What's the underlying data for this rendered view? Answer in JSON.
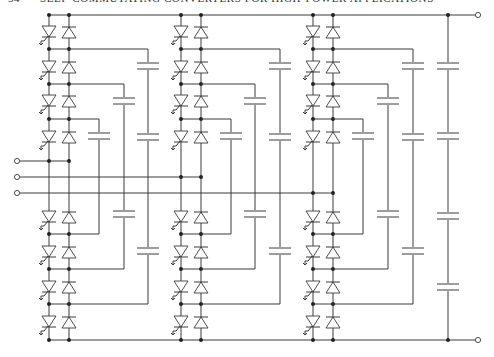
{
  "header": {
    "page_number": "54",
    "running_title": "SELF-COMMUTATING CONVERTERS FOR HIGH-POWER APPLICATIONS"
  },
  "diagram": {
    "type": "five-level flying-capacitor three-phase converter",
    "phases": [
      {
        "name": "phase-a",
        "switches_per_leg": 8,
        "clamp_capacitor_columns": [
          {
            "caps": 1,
            "span": "junction 3 to junction 5"
          },
          {
            "caps": 2,
            "span": "junction 2 to junction 6"
          },
          {
            "caps": 3,
            "span": "junction 1 to junction 7"
          }
        ]
      },
      {
        "name": "phase-b",
        "switches_per_leg": 8,
        "clamp_capacitor_columns": [
          {
            "caps": 1,
            "span": "junction 3 to junction 5"
          },
          {
            "caps": 2,
            "span": "junction 2 to junction 6"
          },
          {
            "caps": 3,
            "span": "junction 1 to junction 7"
          }
        ]
      },
      {
        "name": "phase-c",
        "switches_per_leg": 8,
        "clamp_capacitor_columns": [
          {
            "caps": 1,
            "span": "junction 3 to junction 5"
          },
          {
            "caps": 2,
            "span": "junction 2 to junction 6"
          },
          {
            "caps": 3,
            "span": "junction 1 to junction 7"
          }
        ]
      }
    ],
    "dc_bus_capacitors": 4,
    "device_types": [
      "gto-thyristor",
      "antiparallel-diode",
      "capacitor"
    ],
    "terminals": [
      "dc-positive",
      "dc-negative",
      "ac-a",
      "ac-b",
      "ac-c"
    ]
  }
}
